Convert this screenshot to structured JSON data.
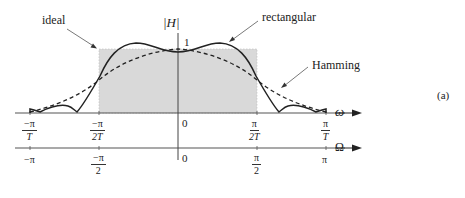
{
  "figure": {
    "panel_label": "(a)",
    "y_axis_label": "|H|",
    "unity_label": "1",
    "annotations": {
      "ideal": "ideal",
      "rectangular": "rectangular",
      "hamming": "Hamming"
    },
    "omega_axis": {
      "label": "ω",
      "ticks": [
        {
          "num": "−π",
          "den": "T"
        },
        {
          "num": "−π",
          "den": "2T"
        },
        {
          "plain": "0"
        },
        {
          "num": "π",
          "den": "2T"
        },
        {
          "num": "π",
          "den": "T"
        }
      ]
    },
    "Omega_axis": {
      "label": "Ω",
      "ticks": [
        {
          "plain": "−π"
        },
        {
          "num": "−π",
          "den": "2"
        },
        {
          "plain": "0"
        },
        {
          "num": "π",
          "den": "2"
        },
        {
          "plain": "π"
        }
      ]
    },
    "colors": {
      "ideal_fill": "#d9d9d9",
      "curve": "#222222",
      "axis": "#555555"
    }
  }
}
